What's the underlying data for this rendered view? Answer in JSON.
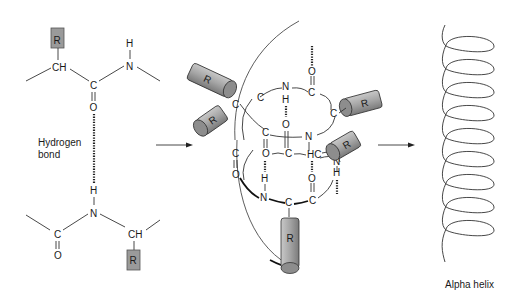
{
  "figure": {
    "panels": [
      {
        "id": "left",
        "description": "Two peptide segments with R side chains linked by a hydrogen bond between C=O and N-H"
      },
      {
        "id": "middle",
        "description": "Peptide backbone coiling with hydrogen bonds (dotted) and cylindrical R groups"
      },
      {
        "id": "right",
        "description": "Coil representing alpha helix"
      }
    ]
  },
  "labels": {
    "hydrogen_bond_line1": "Hydrogen",
    "hydrogen_bond_line2": "bond",
    "alpha_helix": "Alpha helix"
  },
  "atoms": {
    "R": "R",
    "CH": "CH",
    "C": "C",
    "O": "O",
    "N": "N",
    "H": "H",
    "HC": "HC"
  },
  "colors": {
    "r_group_fill": "#9a9a9a",
    "line": "#333333",
    "background": "#ffffff"
  }
}
